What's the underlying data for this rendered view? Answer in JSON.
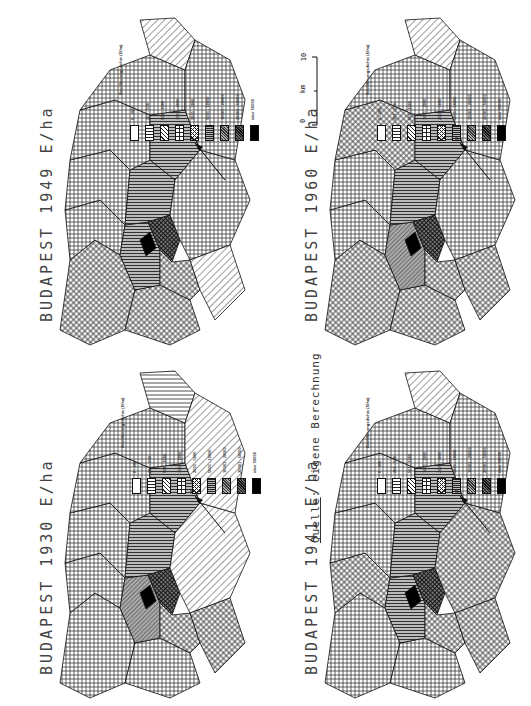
{
  "figure": {
    "source_note": {
      "prefix": "Quelle",
      "rest": ": eigene Berechnungen"
    },
    "scale_bar": {
      "unit": "km",
      "ticks": [
        "0",
        "10"
      ]
    },
    "legend": {
      "header": "Bevölkerungsdichte (E/ha)",
      "classes": [
        {
          "label": "0 - 200",
          "pattern": "empty"
        },
        {
          "label": "201 - 500",
          "pattern": "horizontal-lines"
        },
        {
          "label": "501 - 1000",
          "pattern": "diagonal-lines"
        },
        {
          "label": "1001 - 2000",
          "pattern": "grid"
        },
        {
          "label": "2001 - 5000",
          "pattern": "diagonal-crosshatch"
        },
        {
          "label": "5001 - 10000",
          "pattern": "dense-horizontal"
        },
        {
          "label": "10001 - 20000",
          "pattern": "dense-diagonal"
        },
        {
          "label": "20001 - 50000",
          "pattern": "dark-crosshatch"
        },
        {
          "label": "über 50000",
          "pattern": "solid-black"
        }
      ]
    },
    "panels": [
      {
        "title": "BUDAPEST 1949 E/ha",
        "year": "1949"
      },
      {
        "title": "BUDAPEST 1960 E/ha",
        "year": "1960"
      },
      {
        "title": "BUDAPEST 1930 E/ha",
        "year": "1930"
      },
      {
        "title": "BUDAPEST 1941 E/ha",
        "year": "1941"
      }
    ]
  },
  "chart_data": {
    "type": "choropleth-map",
    "panels": [
      "1930",
      "1941",
      "1949",
      "1960"
    ],
    "legend": [
      "0 - 200",
      "201 - 500",
      "501 - 1000",
      "1001 - 2000",
      "2001 - 5000",
      "5001 - 10000",
      "10001 - 20000",
      "20001 - 50000",
      "über 50000"
    ],
    "north_arrow": true,
    "scale": "0 - 10 km",
    "source": "Quelle: eigene Berechnungen"
  }
}
